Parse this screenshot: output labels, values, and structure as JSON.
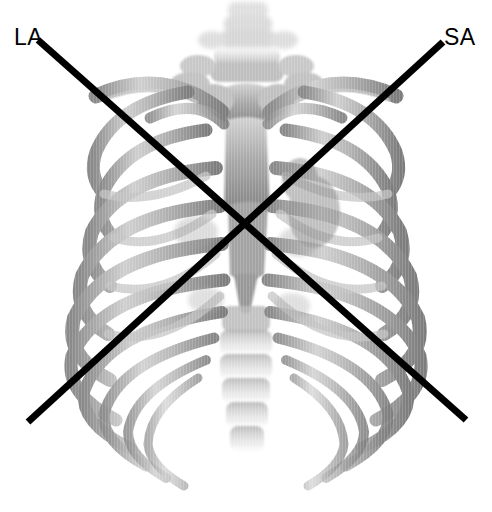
{
  "figure": {
    "background_color": "#ffffff",
    "width": 492,
    "height": 512,
    "modality_label": "3d-volume-rendered-thorax"
  },
  "anatomy": {
    "name": "human-rib-cage",
    "description": "Anterior view of a 3D volume-rendered thoracic skeleton",
    "bone_color": "#9a9a9a",
    "bone_color_light": "#c9c9c9",
    "bone_color_dark": "#6e6e6e",
    "parts": [
      "cervical-vertebrae",
      "clavicle-left",
      "clavicle-right",
      "sternum",
      "thoracic-spine",
      "ribs-left",
      "ribs-right",
      "costal-cartilage",
      "xiphoid-process"
    ]
  },
  "overlay": {
    "line_color": "#000000",
    "line_width": 7,
    "axes": [
      {
        "id": "la",
        "label": "LA",
        "x1": 38,
        "y1": 40,
        "x2": 466,
        "y2": 420,
        "label_x": 14,
        "label_y": 26
      },
      {
        "id": "sa",
        "label": "SA",
        "x1": 443,
        "y1": 42,
        "x2": 28,
        "y2": 422,
        "label_x": 444,
        "label_y": 26
      }
    ],
    "intersection": {
      "x": 250,
      "y": 228
    }
  }
}
